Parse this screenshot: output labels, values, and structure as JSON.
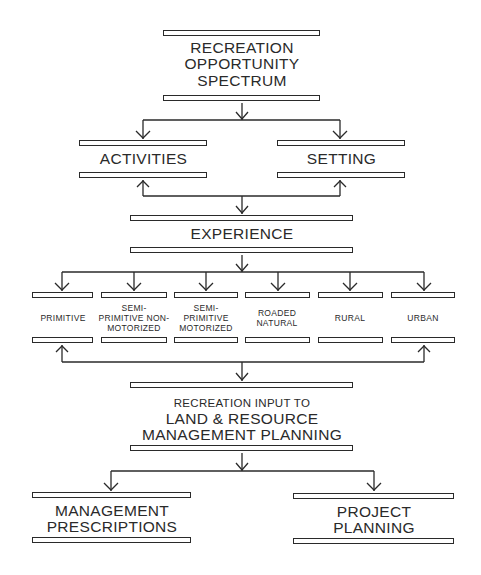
{
  "diagram": {
    "title": "RECREATION OPPORTUNITY SPECTRUM",
    "nodes": {
      "ros": {
        "label": "RECREATION\nOPPORTUNITY\nSPECTRUM"
      },
      "activities": {
        "label": "ACTIVITIES"
      },
      "setting": {
        "label": "SETTING"
      },
      "experience": {
        "label": "EXPERIENCE"
      },
      "classes": [
        {
          "label": "PRIMITIVE"
        },
        {
          "label": "SEMI-\nPRIMITIVE NON-\nMOTORIZED"
        },
        {
          "label": "SEMI-\nPRIMITIVE\nMOTORIZED"
        },
        {
          "label": "ROADED\nNATURAL"
        },
        {
          "label": "RURAL"
        },
        {
          "label": "URBAN"
        }
      ],
      "input": {
        "line1": "RECREATION INPUT TO",
        "line2": "LAND & RESOURCE\nMANAGEMENT PLANNING"
      },
      "prescriptions": {
        "label": "MANAGEMENT\nPRESCRIPTIONS"
      },
      "project": {
        "label": "PROJECT\nPLANNING"
      }
    },
    "edges": [
      {
        "from": "RECREATION OPPORTUNITY SPECTRUM",
        "to": "ACTIVITIES"
      },
      {
        "from": "RECREATION OPPORTUNITY SPECTRUM",
        "to": "SETTING"
      },
      {
        "from": "ACTIVITIES",
        "to": "EXPERIENCE",
        "bidirectional": true
      },
      {
        "from": "SETTING",
        "to": "EXPERIENCE",
        "bidirectional": true
      },
      {
        "from": "EXPERIENCE",
        "to": "PRIMITIVE"
      },
      {
        "from": "EXPERIENCE",
        "to": "SEMI-PRIMITIVE NON-MOTORIZED"
      },
      {
        "from": "EXPERIENCE",
        "to": "SEMI-PRIMITIVE MOTORIZED"
      },
      {
        "from": "EXPERIENCE",
        "to": "ROADED NATURAL"
      },
      {
        "from": "EXPERIENCE",
        "to": "RURAL"
      },
      {
        "from": "EXPERIENCE",
        "to": "URBAN"
      },
      {
        "from": "PRIMITIVE..URBAN",
        "to": "RECREATION INPUT TO LAND & RESOURCE MANAGEMENT PLANNING"
      },
      {
        "from": "RECREATION INPUT TO LAND & RESOURCE MANAGEMENT PLANNING",
        "to": "MANAGEMENT PRESCRIPTIONS"
      },
      {
        "from": "RECREATION INPUT TO LAND & RESOURCE MANAGEMENT PLANNING",
        "to": "PROJECT PLANNING"
      }
    ],
    "colors": {
      "ink": "#2a2a2a",
      "background": "#ffffff"
    }
  }
}
